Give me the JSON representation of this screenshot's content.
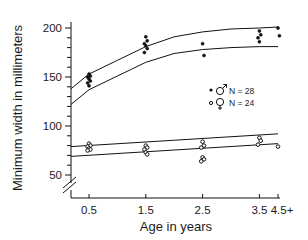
{
  "chart_data": {
    "type": "scatter",
    "title": "",
    "xlabel": "Age in years",
    "ylabel": "Minimum width in millimeters",
    "x_ticks": [
      "0.5",
      "1.5",
      "2.5",
      "3.5",
      "4.5+"
    ],
    "x_tick_values": [
      0.5,
      1.5,
      2.5,
      3.5,
      4.5
    ],
    "y_ticks": [
      "50",
      "100",
      "150",
      "200"
    ],
    "y_tick_values": [
      50,
      100,
      150,
      200
    ],
    "ylim": [
      35,
      205
    ],
    "y_axis_break": true,
    "grid": false,
    "legend_position": "center-right",
    "legend": [
      {
        "symbol": "filled-dot",
        "sex": "male",
        "label": "N = 28"
      },
      {
        "symbol": "open-dot",
        "sex": "female",
        "label": "N = 24"
      }
    ],
    "series": [
      {
        "name": "Male (N = 28)",
        "marker": "filled",
        "points": [
          [
            0.5,
            153
          ],
          [
            0.5,
            151
          ],
          [
            0.5,
            150
          ],
          [
            0.5,
            148
          ],
          [
            0.5,
            146
          ],
          [
            0.5,
            144
          ],
          [
            0.5,
            141
          ],
          [
            1.5,
            191
          ],
          [
            1.5,
            187
          ],
          [
            1.5,
            184
          ],
          [
            1.5,
            182
          ],
          [
            1.5,
            179
          ],
          [
            1.5,
            175
          ],
          [
            2.5,
            184
          ],
          [
            2.5,
            172
          ],
          [
            3.5,
            197
          ],
          [
            3.5,
            193
          ],
          [
            3.5,
            190
          ],
          [
            3.5,
            186
          ],
          [
            4.5,
            200
          ],
          [
            4.5,
            192
          ]
        ]
      },
      {
        "name": "Female (N = 24)",
        "marker": "open",
        "points": [
          [
            0.5,
            82
          ],
          [
            0.5,
            80
          ],
          [
            0.5,
            79
          ],
          [
            0.5,
            77
          ],
          [
            0.5,
            76
          ],
          [
            0.5,
            75
          ],
          [
            1.5,
            80
          ],
          [
            1.5,
            78
          ],
          [
            1.5,
            76
          ],
          [
            1.5,
            73
          ],
          [
            1.5,
            71
          ],
          [
            2.5,
            84
          ],
          [
            2.5,
            80
          ],
          [
            2.5,
            78
          ],
          [
            2.5,
            68
          ],
          [
            2.5,
            66
          ],
          [
            2.5,
            64
          ],
          [
            3.5,
            88
          ],
          [
            3.5,
            85
          ],
          [
            3.5,
            81
          ],
          [
            4.5,
            79
          ]
        ]
      }
    ],
    "envelope_curves": [
      {
        "name": "male-upper",
        "points": [
          [
            0.0,
            138
          ],
          [
            0.5,
            153
          ],
          [
            1.0,
            167
          ],
          [
            1.5,
            181
          ],
          [
            2.0,
            191
          ],
          [
            2.5,
            196
          ],
          [
            3.0,
            199
          ],
          [
            3.5,
            200
          ],
          [
            4.5,
            201
          ]
        ]
      },
      {
        "name": "male-lower",
        "points": [
          [
            0.0,
            122
          ],
          [
            0.5,
            137
          ],
          [
            1.0,
            151
          ],
          [
            1.5,
            165
          ],
          [
            2.0,
            174
          ],
          [
            2.5,
            178
          ],
          [
            3.0,
            180
          ],
          [
            3.5,
            181
          ],
          [
            4.5,
            181
          ]
        ]
      },
      {
        "name": "female-upper",
        "points": [
          [
            0.0,
            79
          ],
          [
            4.5,
            92
          ]
        ]
      },
      {
        "name": "female-lower",
        "points": [
          [
            0.0,
            69
          ],
          [
            4.5,
            82
          ]
        ]
      }
    ]
  }
}
